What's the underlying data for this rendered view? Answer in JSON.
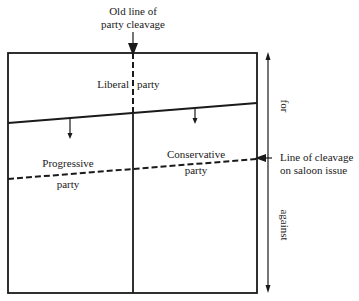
{
  "diagram": {
    "labels": {
      "old_line_1": "Old line of",
      "old_line_2": "party cleavage",
      "liberal_1": "Liberal",
      "liberal_2": "party",
      "progressive_1": "Progressive",
      "progressive_2": "party",
      "conservative_1": "Conservative",
      "conservative_2": "party",
      "saloon_1": "Line of cleavage",
      "saloon_2": "on saloon issue",
      "axis_for": "for",
      "axis_against": "against"
    },
    "colors": {
      "ink": "#1a1a1a",
      "background": "#ffffff"
    }
  }
}
